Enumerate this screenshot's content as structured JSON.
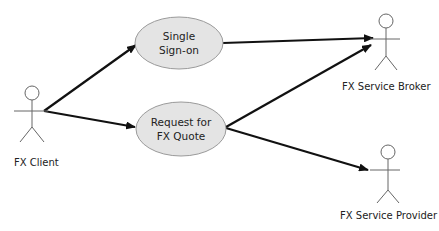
{
  "diagram": {
    "type": "use-case",
    "actors": [
      {
        "id": "fx-client",
        "label": "FX Client"
      },
      {
        "id": "fx-service-broker",
        "label": "FX Service Broker"
      },
      {
        "id": "fx-service-provider",
        "label": "FX Service Provider"
      }
    ],
    "use_cases": [
      {
        "id": "single-sign-on",
        "line1": "Single",
        "line2": "Sign-on"
      },
      {
        "id": "request-fx-quote",
        "line1": "Request for",
        "line2": "FX Quote"
      }
    ],
    "edges": [
      {
        "from": "FX Client",
        "to": "Single Sign-on"
      },
      {
        "from": "FX Client",
        "to": "Request for FX Quote"
      },
      {
        "from": "Single Sign-on",
        "to": "FX Service Broker"
      },
      {
        "from": "Request for FX Quote",
        "to": "FX Service Broker"
      },
      {
        "from": "Request for FX Quote",
        "to": "FX Service Provider"
      }
    ],
    "colors": {
      "ellipse_fill": "#e4e4e4",
      "ellipse_stroke": "#9a9a9a",
      "line": "#111111"
    }
  }
}
